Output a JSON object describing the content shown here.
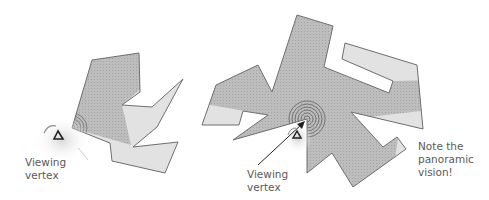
{
  "colors": {
    "background": "#ffffff",
    "visible_fill": "#bdbdbd",
    "hidden_fill": "#e2e2e2",
    "outline": "#6e6e6e",
    "text": "#5a5a5a"
  },
  "figures": [
    {
      "id": "left",
      "viewing_label": [
        "Viewing",
        "vertex"
      ],
      "viewing_vertex": [
        72,
        128
      ]
    },
    {
      "id": "right",
      "viewing_label": [
        "Viewing",
        "vertex"
      ],
      "viewing_vertex": [
        307,
        119
      ],
      "note": [
        "Note the",
        "panoramic",
        "vision!"
      ]
    }
  ],
  "labels": {
    "left_viewing_line1": "Viewing",
    "left_viewing_line2": "vertex",
    "right_viewing_line1": "Viewing",
    "right_viewing_line2": "vertex",
    "note_line1": "Note the",
    "note_line2": "panoramic",
    "note_line3": "vision!"
  }
}
